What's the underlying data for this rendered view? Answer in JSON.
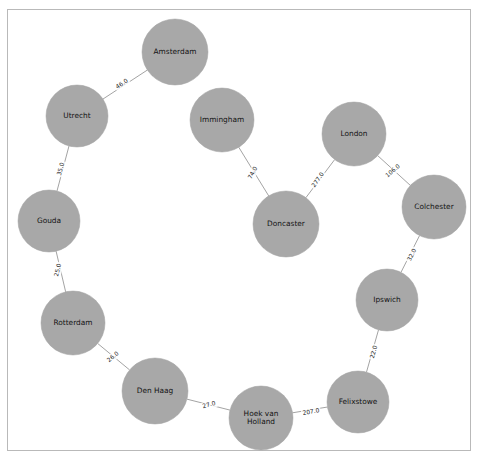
{
  "figure": {
    "title": "",
    "background_color": "#ffffff",
    "frame_color": "#b9b9b9",
    "node_color": "#a8a8a8",
    "edge_color": "#999999",
    "label_color": "#131313"
  },
  "chart_data": {
    "type": "diagram",
    "diagram_type": "network-graph",
    "title": "",
    "xlabel": "",
    "ylabel": "",
    "grid": false,
    "legend": null,
    "directed": false,
    "layout": "circular",
    "node_count": 12,
    "edge_count": 11,
    "nodes": [
      {
        "id": "amsterdam",
        "label": "Amsterdam",
        "label_lines": [
          "Amsterdam"
        ],
        "x": 175,
        "y": 52,
        "r": 33
      },
      {
        "id": "utrecht",
        "label": "Utrecht",
        "label_lines": [
          "Utrecht"
        ],
        "x": 77,
        "y": 116,
        "r": 31
      },
      {
        "id": "gouda",
        "label": "Gouda",
        "label_lines": [
          "Gouda"
        ],
        "x": 49,
        "y": 221,
        "r": 31
      },
      {
        "id": "rotterdam",
        "label": "Rotterdam",
        "label_lines": [
          "Rotterdam"
        ],
        "x": 73,
        "y": 323,
        "r": 32
      },
      {
        "id": "denhaag",
        "label": "Den Haag",
        "label_lines": [
          "Den Haag"
        ],
        "x": 155,
        "y": 391,
        "r": 33
      },
      {
        "id": "hoekvanholland",
        "label": "Hoek van Holland",
        "label_lines": [
          "Hoek van",
          "Holland"
        ],
        "x": 261,
        "y": 418,
        "r": 32
      },
      {
        "id": "felixstowe",
        "label": "Felixstowe",
        "label_lines": [
          "Felixstowe"
        ],
        "x": 358,
        "y": 402,
        "r": 31
      },
      {
        "id": "ipswich",
        "label": "Ipswich",
        "label_lines": [
          "Ipswich"
        ],
        "x": 387,
        "y": 300,
        "r": 31
      },
      {
        "id": "colchester",
        "label": "Colchester",
        "label_lines": [
          "Colchester"
        ],
        "x": 434,
        "y": 207,
        "r": 32
      },
      {
        "id": "london",
        "label": "London",
        "label_lines": [
          "London"
        ],
        "x": 354,
        "y": 134,
        "r": 32
      },
      {
        "id": "doncaster",
        "label": "Doncaster",
        "label_lines": [
          "Doncaster"
        ],
        "x": 286,
        "y": 224,
        "r": 33
      },
      {
        "id": "immingham",
        "label": "Immingham",
        "label_lines": [
          "Immingham"
        ],
        "x": 222,
        "y": 120,
        "r": 32
      }
    ],
    "edges": [
      {
        "source": "amsterdam",
        "target": "utrecht",
        "weight": 46.0,
        "label": "46.0",
        "label_x": 122,
        "label_y": 84,
        "label_rotation": -33
      },
      {
        "source": "utrecht",
        "target": "gouda",
        "weight": 35.0,
        "label": "35.0",
        "label_x": 61,
        "label_y": 169,
        "label_rotation": -75
      },
      {
        "source": "gouda",
        "target": "rotterdam",
        "weight": 25.0,
        "label": "25.0",
        "label_x": 58,
        "label_y": 270,
        "label_rotation": -77
      },
      {
        "source": "rotterdam",
        "target": "denhaag",
        "weight": 26.0,
        "label": "26.0",
        "label_x": 113,
        "label_y": 357,
        "label_rotation": -40
      },
      {
        "source": "denhaag",
        "target": "hoekvanholland",
        "weight": 27.0,
        "label": "27.0",
        "label_x": 209,
        "label_y": 405,
        "label_rotation": -15
      },
      {
        "source": "hoekvanholland",
        "target": "felixstowe",
        "weight": 207.0,
        "label": "207.0",
        "label_x": 311,
        "label_y": 412,
        "label_rotation": -10
      },
      {
        "source": "felixstowe",
        "target": "ipswich",
        "weight": 22.0,
        "label": "22.0",
        "label_x": 374,
        "label_y": 352,
        "label_rotation": -74
      },
      {
        "source": "ipswich",
        "target": "colchester",
        "weight": 32.0,
        "label": "32.0",
        "label_x": 412,
        "label_y": 255,
        "label_rotation": -63
      },
      {
        "source": "colchester",
        "target": "london",
        "weight": 106.0,
        "label": "106.0",
        "label_x": 393,
        "label_y": 171,
        "label_rotation": -40
      },
      {
        "source": "london",
        "target": "doncaster",
        "weight": 277.0,
        "label": "277.0",
        "label_x": 318,
        "label_y": 180,
        "label_rotation": -55
      },
      {
        "source": "doncaster",
        "target": "immingham",
        "weight": 74.0,
        "label": "74.0",
        "label_x": 253,
        "label_y": 173,
        "label_rotation": -62
      }
    ]
  }
}
